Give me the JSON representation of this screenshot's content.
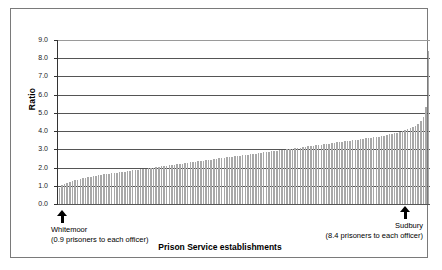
{
  "chart_data": {
    "type": "bar",
    "title": "",
    "xlabel": "Prison Service establishments",
    "ylabel": "Ratio",
    "ylim": [
      0.0,
      9.0
    ],
    "ytick_labels": [
      "9.0",
      "8.0",
      "7.0",
      "6.0",
      "5.0",
      "4.0",
      "3.0",
      "2.0",
      "1.0",
      "0.0"
    ],
    "ytick_values": [
      9.0,
      8.0,
      7.0,
      6.0,
      5.0,
      4.0,
      3.0,
      2.0,
      1.0,
      0.0
    ],
    "grid": true,
    "legend": "none",
    "categories_label": "Prison Service establishments (sorted ascending by ratio)",
    "values": [
      0.9,
      1.05,
      1.12,
      1.18,
      1.22,
      1.26,
      1.3,
      1.34,
      1.38,
      1.42,
      1.45,
      1.48,
      1.5,
      1.53,
      1.56,
      1.58,
      1.6,
      1.62,
      1.64,
      1.66,
      1.68,
      1.7,
      1.72,
      1.74,
      1.76,
      1.78,
      1.8,
      1.82,
      1.84,
      1.86,
      1.88,
      1.9,
      1.92,
      1.94,
      1.96,
      1.98,
      2.0,
      2.02,
      2.04,
      2.06,
      2.08,
      2.1,
      2.12,
      2.14,
      2.16,
      2.18,
      2.2,
      2.22,
      2.24,
      2.26,
      2.28,
      2.3,
      2.32,
      2.34,
      2.36,
      2.38,
      2.4,
      2.42,
      2.44,
      2.46,
      2.48,
      2.5,
      2.52,
      2.54,
      2.56,
      2.58,
      2.6,
      2.62,
      2.63,
      2.65,
      2.67,
      2.69,
      2.71,
      2.73,
      2.75,
      2.77,
      2.79,
      2.81,
      2.83,
      2.85,
      2.87,
      2.89,
      2.91,
      2.93,
      2.95,
      2.97,
      2.99,
      3.0,
      3.02,
      3.04,
      3.06,
      3.08,
      3.1,
      3.12,
      3.14,
      3.16,
      3.18,
      3.2,
      3.22,
      3.24,
      3.26,
      3.28,
      3.3,
      3.32,
      3.34,
      3.36,
      3.38,
      3.4,
      3.42,
      3.44,
      3.46,
      3.48,
      3.5,
      3.52,
      3.54,
      3.56,
      3.58,
      3.6,
      3.62,
      3.64,
      3.66,
      3.68,
      3.7,
      3.73,
      3.76,
      3.79,
      3.82,
      3.85,
      3.88,
      3.92,
      3.96,
      4.0,
      4.05,
      4.1,
      4.16,
      4.22,
      4.3,
      4.4,
      4.55,
      4.8,
      5.3,
      8.4
    ],
    "annotations": [
      {
        "id": "whitemoor",
        "name": "Whitemoor",
        "detail": "(0.9 prisoners to each officer)",
        "value": 0.9,
        "position": "left"
      },
      {
        "id": "sudbury",
        "name": "Sudbury",
        "detail": "(8.4 prisoners to each officer)",
        "value": 8.4,
        "position": "right"
      }
    ],
    "colors": {
      "bar": "#a8a8a8",
      "gridline": "#555555",
      "axis": "#333333",
      "frame": "#7a7a7a",
      "background": "#ffffff"
    }
  }
}
